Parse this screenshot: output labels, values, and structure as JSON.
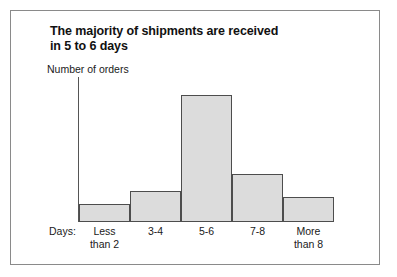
{
  "figure": {
    "title_line1": "The majority of shipments are received",
    "title_line2": "in 5 to 6 days",
    "axis_prefix_label": "Days:",
    "frame_color": "#8a8a8a",
    "bar_fill_color": "#dcdcdc",
    "bar_edge_color": "#4d4d4d"
  },
  "chart_data": {
    "type": "bar",
    "title": "The majority of shipments are received in 5 to 6 days",
    "xlabel": "Days:",
    "ylabel": "Number of orders",
    "categories": [
      "Less than 2",
      "3-4",
      "5-6",
      "7-8",
      "More than 8"
    ],
    "category_lines": [
      [
        "Less",
        "than 2"
      ],
      [
        "3-4",
        ""
      ],
      [
        "5-6",
        ""
      ],
      [
        "7-8",
        ""
      ],
      [
        "More",
        "than 8"
      ]
    ],
    "values": [
      19,
      32,
      132,
      50,
      26
    ],
    "ylim": [
      0,
      145
    ],
    "xtick_labels": [
      "Less than 2",
      "3-4",
      "5-6",
      "7-8",
      "More than 8"
    ],
    "ytick_labels": [],
    "grid": false,
    "legend": null,
    "annotations": [],
    "style": "histogram, adjacent bars, no y tick marks"
  }
}
